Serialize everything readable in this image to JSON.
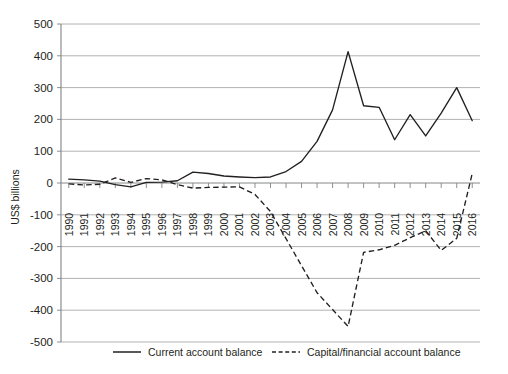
{
  "chart_data": {
    "type": "line",
    "title": "",
    "xlabel": "",
    "ylabel": "US$ billions",
    "ylim": [
      -500,
      500
    ],
    "ytick_labels": [
      "500",
      "400",
      "300",
      "200",
      "100",
      "0",
      "-100",
      "-200",
      "-300",
      "-400",
      "-500"
    ],
    "ytick_values": [
      500,
      400,
      300,
      200,
      100,
      0,
      -100,
      -200,
      -300,
      -400,
      -500
    ],
    "grid": true,
    "legend_position": "bottom",
    "categories": [
      "1990",
      "1991",
      "1992",
      "1993",
      "1994",
      "1995",
      "1996",
      "1997",
      "1998",
      "1999",
      "2000",
      "2001",
      "2002",
      "2003",
      "2004",
      "2005",
      "2006",
      "2007",
      "2008",
      "2009",
      "2010",
      "2011",
      "2012",
      "2013",
      "2014",
      "2015",
      "2016"
    ],
    "series": [
      {
        "name": "Current account balance",
        "style": "solid",
        "values": [
          12,
          10,
          6,
          -5,
          -12,
          2,
          3,
          7,
          34,
          30,
          22,
          19,
          17,
          19,
          36,
          68,
          131,
          230,
          413,
          243,
          238,
          136,
          215,
          148,
          220,
          300,
          196
        ]
      },
      {
        "name": "Capital/financial account balance",
        "style": "dashed",
        "values": [
          -3,
          -6,
          -4,
          16,
          2,
          14,
          10,
          -5,
          -16,
          -14,
          -13,
          -12,
          -36,
          -90,
          -175,
          -260,
          -345,
          -398,
          -451,
          -218,
          -210,
          -196,
          -172,
          -150,
          -212,
          -174,
          30
        ]
      }
    ],
    "legend": [
      {
        "label": "Current account balance",
        "style": "solid"
      },
      {
        "label": "Capital/financial account balance",
        "style": "dashed"
      }
    ]
  }
}
